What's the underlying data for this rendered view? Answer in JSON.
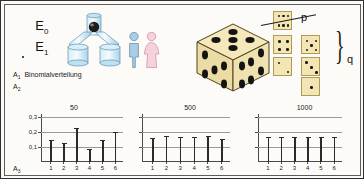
{
  "page": {
    "background": "#fcfbf8",
    "frame_color": "#5d5d5d"
  },
  "sections": {
    "a1": {
      "tag": "A",
      "tag_sub": "1",
      "caption": "Binomialverteilung",
      "fraction": {
        "numerator": "E",
        "numerator_sub": "0",
        "denominator": "E",
        "denominator_sub": "1",
        "bar_color": "#23527a"
      },
      "apparatus": {
        "name": "urn-funnel-apparatus",
        "ball_color": "#1b1b1b",
        "glass_color": "#bcdcee"
      },
      "people": [
        {
          "name": "male-figure",
          "color": "#a8cde4"
        },
        {
          "name": "female-figure",
          "color": "#f2c9d4"
        }
      ]
    },
    "a2": {
      "tag": "A",
      "tag_sub": "2",
      "big_die": {
        "name": "large-die",
        "top_face": 5,
        "left_face": 5,
        "right_face": 6,
        "body_color": "#f3e6b4"
      },
      "p_label": "p",
      "q_label": "q",
      "small_dice": [
        {
          "value": 6,
          "group": "p"
        },
        {
          "value": 4,
          "group": "q"
        },
        {
          "value": 5,
          "group": "q"
        },
        {
          "value": 2,
          "group": "q"
        },
        {
          "value": 3,
          "group": "q"
        },
        {
          "value": 1,
          "group": "q"
        }
      ]
    },
    "a3": {
      "tag": "A",
      "tag_sub": "3"
    }
  },
  "chart_data": [
    {
      "type": "bar",
      "title": "50",
      "categories": [
        "1",
        "2",
        "3",
        "4",
        "5",
        "6"
      ],
      "values": [
        0.15,
        0.13,
        0.23,
        0.09,
        0.15,
        0.2
      ],
      "ylim": [
        0,
        0.32
      ],
      "yticks": [
        0.1,
        0.2,
        0.3
      ],
      "yticklabels": [
        "0,1",
        "0,2",
        "0,3"
      ],
      "xlabel": "",
      "ylabel": "",
      "grid": true,
      "legend": "none"
    },
    {
      "type": "bar",
      "title": "500",
      "categories": [
        "1",
        "2",
        "3",
        "4",
        "5",
        "6"
      ],
      "values": [
        0.16,
        0.175,
        0.165,
        0.17,
        0.175,
        0.155
      ],
      "ylim": [
        0,
        0.32
      ],
      "yticks": [
        0.1,
        0.2,
        0.3
      ],
      "yticklabels": [
        "",
        "",
        ""
      ],
      "xlabel": "",
      "ylabel": "",
      "grid": true,
      "legend": "none"
    },
    {
      "type": "bar",
      "title": "1000",
      "categories": [
        "1",
        "2",
        "3",
        "4",
        "5",
        "6"
      ],
      "values": [
        0.167,
        0.168,
        0.166,
        0.168,
        0.167,
        0.169
      ],
      "ylim": [
        0,
        0.32
      ],
      "yticks": [
        0.1,
        0.2,
        0.3
      ],
      "yticklabels": [
        "",
        "",
        ""
      ],
      "xlabel": "",
      "ylabel": "",
      "grid": true,
      "legend": "none"
    }
  ]
}
